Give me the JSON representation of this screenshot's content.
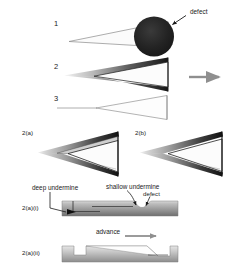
{
  "figure": {
    "background_color": "#ffffff",
    "ink_color": "#1a1a1a",
    "arrow_color": "#8f8f8f",
    "defect_fill": "#1f1f1f"
  },
  "stages": {
    "label_1": "1",
    "label_2": "2",
    "label_3": "3"
  },
  "annotations": {
    "defect_top": "defect",
    "deep_undermine": "deep undermine",
    "shallow_undermine": "shallow undermine",
    "defect_detail": "defect",
    "advance": "advance"
  },
  "panels": {
    "a": "2(a)",
    "b": "2(b)",
    "a_i": "2(a)(i)",
    "a_ii": "2(a)(ii)"
  },
  "icons": {
    "process_arrow": "right-arrow-icon",
    "defect_pointer": "arrow-pointer-icon",
    "advance_arrow": "right-arrow-icon"
  }
}
